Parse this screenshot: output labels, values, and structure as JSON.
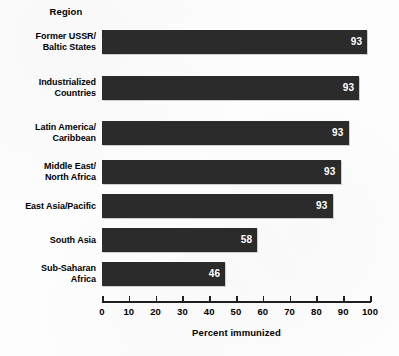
{
  "chart_data": {
    "type": "bar",
    "orientation": "horizontal",
    "title": "",
    "clipped_title_fragment": "",
    "category_axis_header": "Region",
    "categories": [
      "Former USSR/\nBaltic States",
      "Industrialized\nCountries",
      "Latin America/\nCaribbean",
      "Middle East/\nNorth Africa",
      "East Asia/Pacific",
      "South Asia",
      "Sub-Saharan\nAfrica"
    ],
    "values": [
      93,
      93,
      93,
      93,
      93,
      58,
      46
    ],
    "bar_pixel_values": [
      99,
      96,
      92,
      89,
      86,
      58,
      46
    ],
    "value_labels": [
      "93",
      "93",
      "93",
      "93",
      "93",
      "58",
      "46"
    ],
    "xlabel": "Percent immunized",
    "ylabel": "Region",
    "xlim": [
      0,
      100
    ],
    "xticks": [
      0,
      10,
      20,
      30,
      40,
      50,
      60,
      70,
      80,
      90,
      100
    ],
    "xtick_labels": [
      "0",
      "10",
      "20",
      "30",
      "40",
      "50",
      "60",
      "70",
      "80",
      "90",
      "100"
    ],
    "grid": false,
    "legend": false,
    "bar_color": "#2b2b2b",
    "value_label_color": "#ffffff",
    "background_color": "#fdfdfd"
  },
  "rows": [
    {
      "label_line1": "Former USSR/",
      "label_line2": "Baltic States",
      "value": "93"
    },
    {
      "label_line1": "Industrialized",
      "label_line2": "Countries",
      "value": "93"
    },
    {
      "label_line1": "Latin America/",
      "label_line2": "Caribbean",
      "value": "93"
    },
    {
      "label_line1": "Middle East/",
      "label_line2": "North Africa",
      "value": "93"
    },
    {
      "label_line1": "East Asia/Pacific",
      "label_line2": "",
      "value": "93"
    },
    {
      "label_line1": "South Asia",
      "label_line2": "",
      "value": "58"
    },
    {
      "label_line1": "Sub-Saharan",
      "label_line2": "Africa",
      "value": "46"
    }
  ],
  "axis": {
    "title": "Percent immunized",
    "ticks": [
      "0",
      "10",
      "20",
      "30",
      "40",
      "50",
      "60",
      "70",
      "80",
      "90",
      "100"
    ]
  },
  "header": {
    "region_label": "Region"
  }
}
